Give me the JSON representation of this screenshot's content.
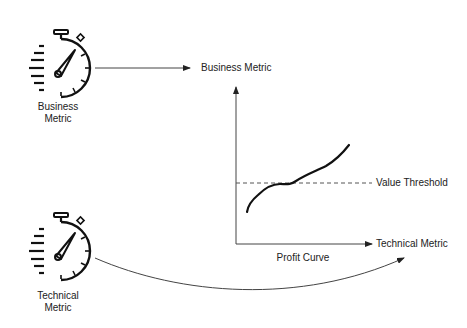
{
  "nodes": {
    "business": {
      "label_line1": "Business",
      "label_line2": "Metric",
      "icon": "stopwatch-icon"
    },
    "technical": {
      "label_line1": "Technical",
      "label_line2": "Metric",
      "icon": "stopwatch-icon"
    }
  },
  "chart": {
    "y_axis_label": "Business Metric",
    "x_axis_label": "Technical Metric",
    "threshold_label": "Value Threshold",
    "curve_label": "Profit Curve"
  },
  "colors": {
    "line": "#222222",
    "axis": "#444444",
    "dashed": "#555555"
  }
}
